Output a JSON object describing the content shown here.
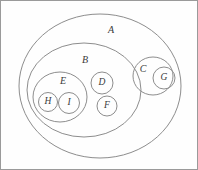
{
  "diagram": {
    "type": "euler-diagram",
    "stroke_color": "#8d8d8d",
    "label_color": "#3a3a3a",
    "background_color": "#fefefe",
    "border_color": "#9a9a9a",
    "sets": [
      {
        "id": "A",
        "label": "A",
        "shape": "ellipse",
        "cx": 99,
        "cy": 85,
        "rx": 81,
        "ry": 72,
        "label_x": 110,
        "label_y": 30,
        "contains": [
          "B",
          "C"
        ]
      },
      {
        "id": "B",
        "label": "B",
        "shape": "ellipse",
        "cx": 83,
        "cy": 89,
        "rx": 57,
        "ry": 47,
        "label_x": 84,
        "label_y": 60,
        "contains": [
          "E",
          "D",
          "F"
        ]
      },
      {
        "id": "C",
        "label": "C",
        "shape": "ellipse",
        "cx": 152,
        "cy": 75,
        "rx": 20,
        "ry": 19,
        "label_x": 142,
        "label_y": 69,
        "contains": [
          "G"
        ]
      },
      {
        "id": "E",
        "label": "E",
        "shape": "ellipse",
        "cx": 59,
        "cy": 96,
        "rx": 27,
        "ry": 25,
        "label_x": 62,
        "label_y": 81,
        "contains": [
          "H",
          "I"
        ]
      },
      {
        "id": "D",
        "label": "D",
        "shape": "circle",
        "cx": 101,
        "cy": 82,
        "rx": 11,
        "ry": 11,
        "label_x": 101,
        "label_y": 82,
        "contains": []
      },
      {
        "id": "F",
        "label": "F",
        "shape": "circle",
        "cx": 106,
        "cy": 105,
        "rx": 10,
        "ry": 10,
        "label_x": 106,
        "label_y": 105,
        "contains": []
      },
      {
        "id": "G",
        "label": "G",
        "shape": "circle",
        "cx": 163,
        "cy": 77,
        "rx": 11,
        "ry": 11,
        "label_x": 163,
        "label_y": 77,
        "contains": []
      },
      {
        "id": "H",
        "label": "H",
        "shape": "circle",
        "cx": 47,
        "cy": 101,
        "rx": 9.5,
        "ry": 9.5,
        "label_x": 47,
        "label_y": 101,
        "contains": []
      },
      {
        "id": "I",
        "label": "I",
        "shape": "circle",
        "cx": 68,
        "cy": 102,
        "rx": 10.5,
        "ry": 10.5,
        "label_x": 68,
        "label_y": 102,
        "contains": []
      }
    ]
  }
}
